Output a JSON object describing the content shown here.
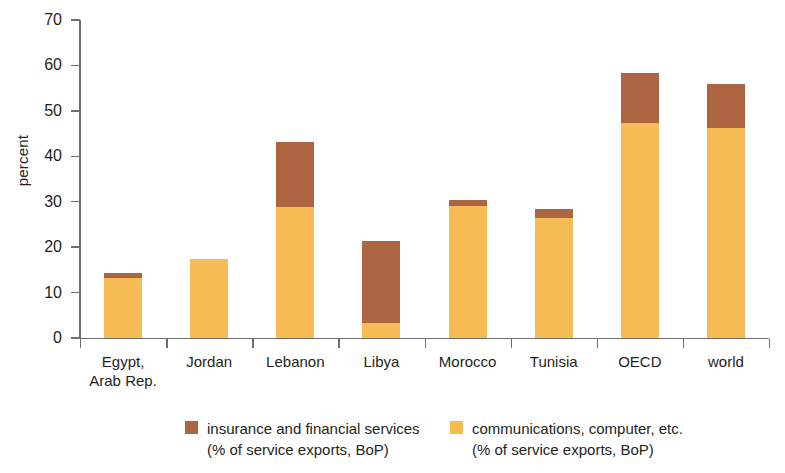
{
  "chart_data": {
    "type": "bar",
    "stacked": true,
    "title": "",
    "subtitle": "",
    "xlabel": "",
    "ylabel": "percent",
    "ylim": [
      0,
      70
    ],
    "ytick_step": 10,
    "ytick_labels": [
      "70",
      "60",
      "50",
      "40",
      "30",
      "20",
      "10",
      "0"
    ],
    "grid": false,
    "legend_position": "bottom",
    "categories": [
      "Egypt,\nArab Rep.",
      "Jordan",
      "Lebanon",
      "Libya",
      "Morocco",
      "Tunisia",
      "OECD",
      "world"
    ],
    "category_labels": [
      {
        "line1": "Egypt,",
        "line2": "Arab Rep."
      },
      {
        "line1": "Jordan",
        "line2": ""
      },
      {
        "line1": "Lebanon",
        "line2": ""
      },
      {
        "line1": "Libya",
        "line2": ""
      },
      {
        "line1": "Morocco",
        "line2": ""
      },
      {
        "line1": "Tunisia",
        "line2": ""
      },
      {
        "line1": "OECD",
        "line2": ""
      },
      {
        "line1": "world",
        "line2": ""
      }
    ],
    "series": [
      {
        "name": "communications, computer, etc.",
        "sublabel": "(% of service exports, BoP)",
        "color": "#f7bb56",
        "values": [
          13.2,
          17.4,
          28.9,
          3.3,
          29.0,
          26.5,
          47.4,
          46.3
        ]
      },
      {
        "name": "insurance and financial services",
        "sublabel": "(% of service exports, BoP)",
        "color": "#ac6441",
        "values": [
          1.1,
          0.0,
          14.3,
          18.1,
          1.4,
          1.9,
          11.0,
          9.7
        ]
      }
    ],
    "totals": [
      14.3,
      17.4,
      43.2,
      21.4,
      30.4,
      28.4,
      58.4,
      56.0
    ]
  },
  "legend": {
    "items": [
      {
        "label": "insurance and financial services",
        "sublabel": "(% of service exports, BoP)",
        "color": "#ac6441"
      },
      {
        "label": "communications, computer, etc.",
        "sublabel": "(% of service exports, BoP)",
        "color": "#f7bb56"
      }
    ]
  },
  "axis": {
    "y_title": "percent"
  }
}
